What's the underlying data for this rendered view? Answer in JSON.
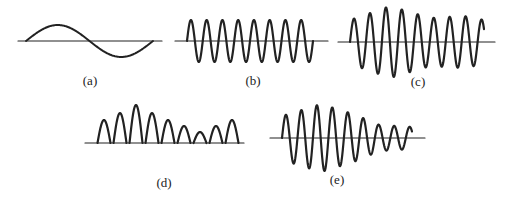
{
  "figure": {
    "panels": [
      {
        "id": "a",
        "label": "(a)",
        "description": "single-cycle sine wave (carrier/modulating signal)"
      },
      {
        "id": "b",
        "label": "(b)",
        "description": "constant-amplitude high-frequency carrier (8 cycles)"
      },
      {
        "id": "c",
        "label": "(c)",
        "description": "amplitude-modulated carrier"
      },
      {
        "id": "d",
        "label": "(d)",
        "description": "rectified (half-wave) AM signal"
      },
      {
        "id": "e",
        "label": "(e)",
        "description": "decaying amplitude-modulated waveform"
      }
    ]
  },
  "colors": {
    "stroke": "#222222",
    "background": "#ffffff"
  }
}
